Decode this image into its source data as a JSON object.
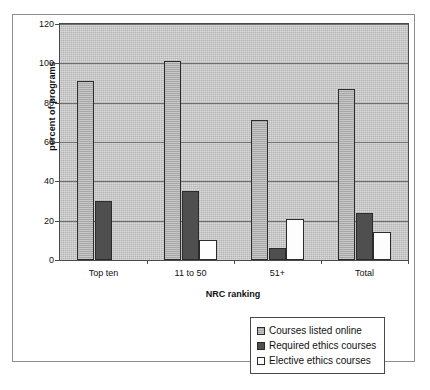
{
  "chart_data": {
    "type": "bar",
    "title": "",
    "xlabel": "NRC ranking",
    "ylabel": "percent of programs",
    "categories": [
      "Top ten",
      "11 to 50",
      "51+",
      "Total"
    ],
    "series": [
      {
        "name": "Courses listed online",
        "values": [
          91,
          101,
          71,
          87
        ],
        "color": "#b0b0b0"
      },
      {
        "name": "Required ethics courses",
        "values": [
          30,
          35,
          6,
          24
        ],
        "color": "#4f4f4f"
      },
      {
        "name": "Elective ethics courses",
        "values": [
          0,
          10,
          21,
          14
        ],
        "color": "#fdfdfd"
      }
    ],
    "ylim": [
      0,
      120
    ],
    "yticks": [
      0,
      20,
      40,
      60,
      80,
      100,
      120
    ],
    "ytick_labels": [
      "0",
      "20",
      "40",
      "60",
      "80",
      "100",
      "120"
    ],
    "grid": true,
    "legend_position": "bottom-right",
    "plot_background": "#c2c2c2"
  }
}
